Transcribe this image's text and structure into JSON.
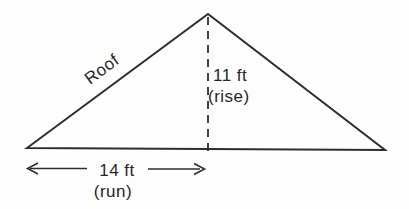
{
  "figure": {
    "type": "roof-rise-run-triangle",
    "labels": {
      "roof": "Roof",
      "rise_value": "11 ft",
      "rise_caption": "(rise)",
      "run_value": "14 ft",
      "run_caption": "(run)"
    },
    "colors": {
      "line": "#2e2e2e",
      "text": "#262626",
      "background": "#fefefe"
    }
  }
}
